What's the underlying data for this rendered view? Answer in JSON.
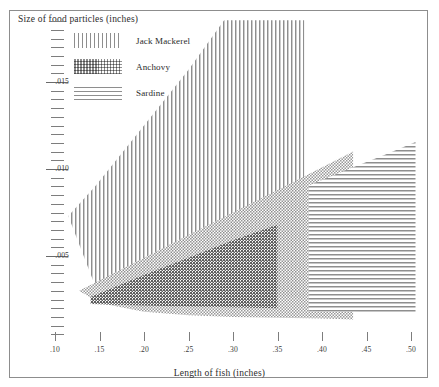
{
  "figure": {
    "y_axis_title": "Size of food particles  (inches)",
    "x_axis_title": "Length of fish  (inches)"
  },
  "legend": {
    "items": [
      {
        "label": "Jack Mackerel",
        "pattern": "vertical-lines",
        "color": "#8a8a8a"
      },
      {
        "label": "Anchovy",
        "pattern": "cross-hatch",
        "color": "#8a8a8a"
      },
      {
        "label": "Sardine",
        "pattern": "horizontal-lines",
        "color": "#8a8a8a"
      }
    ]
  },
  "axes": {
    "y_major_labels": [
      ".015",
      ".010",
      ".005"
    ],
    "y_major_values": [
      0.015,
      0.01,
      0.005
    ],
    "y_minor_count": 22,
    "x_labels": [
      ".10",
      ".15",
      ".20",
      ".25",
      ".30",
      ".35",
      ".40",
      ".45",
      ".50"
    ],
    "x_values": [
      0.1,
      0.15,
      0.2,
      0.25,
      0.3,
      0.35,
      0.4,
      0.45,
      0.5
    ]
  },
  "chart_data": {
    "type": "area",
    "title": "",
    "subtitle": "",
    "xlabel": "Length of fish  (inches)",
    "ylabel": "Size of food particles  (inches)",
    "xlim": [
      0.085,
      0.515
    ],
    "ylim": [
      0.0,
      0.0187
    ],
    "grid": false,
    "legend_position": "top-left inside plot",
    "xtick_labels": [
      ".10",
      ".15",
      ".20",
      ".25",
      ".30",
      ".35",
      ".40",
      ".45",
      ".50"
    ],
    "ytick_labels": [
      ".005",
      ".010",
      ".015"
    ],
    "series": [
      {
        "name": "Jack Mackerel",
        "pattern": "vertical-lines",
        "note": "Wedge of food-particle sizes eaten, widening with fish length; upper bound saturates near .0185 at fish length .29 and band is cut off at fish length .38",
        "band": {
          "x": [
            0.115,
            0.145,
            0.2,
            0.25,
            0.29,
            0.34,
            0.38
          ],
          "upper": [
            0.0073,
            0.009,
            0.0125,
            0.0157,
            0.01855,
            0.01855,
            0.01855
          ],
          "lower": [
            0.0073,
            0.0033,
            0.003,
            0.0029,
            0.0028,
            0.0027,
            0.0026
          ]
        }
      },
      {
        "name": "Anchovy",
        "pattern": "cross-hatch",
        "note": "Wedge widening with fish length, cut off at fish length .435",
        "band": {
          "x": [
            0.127,
            0.15,
            0.2,
            0.25,
            0.3,
            0.35,
            0.4,
            0.435
          ],
          "upper": [
            0.003,
            0.0036,
            0.0049,
            0.0062,
            0.0075,
            0.0088,
            0.0101,
            0.011
          ],
          "lower": [
            0.003,
            0.0023,
            0.0018,
            0.0016,
            0.0015,
            0.00145,
            0.0014,
            0.00135
          ]
        }
      },
      {
        "name": "Sardine",
        "pattern": "horizontal-lines",
        "note": "Two segments: a darker inner wedge overlapping the Anchovy band from .14 to .35, and a right-hand band from .385 to .505",
        "band_left": {
          "x": [
            0.14,
            0.2,
            0.25,
            0.3,
            0.35
          ],
          "upper": [
            0.00265,
            0.0039,
            0.0049,
            0.0059,
            0.0068
          ],
          "lower": [
            0.00225,
            0.00215,
            0.0021,
            0.00205,
            0.002
          ]
        },
        "band_right": {
          "x": [
            0.385,
            0.43,
            0.47,
            0.505
          ],
          "upper": [
            0.00905,
            0.01,
            0.0108,
            0.01155
          ],
          "lower": [
            0.00185,
            0.0018,
            0.00175,
            0.00172
          ]
        }
      }
    ]
  }
}
